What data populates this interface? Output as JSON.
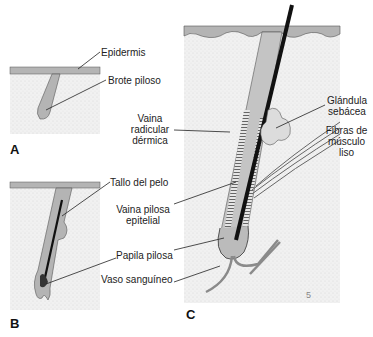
{
  "panels": {
    "a": {
      "label": "A"
    },
    "b": {
      "label": "B"
    },
    "c": {
      "label": "C"
    }
  },
  "labels": {
    "epidermis": "Epidermis",
    "brote_piloso": "Brote piloso",
    "tallo_del_pelo": "Tallo del pelo",
    "vaina_radicular_1": "Vaina",
    "vaina_radicular_2": "radicular",
    "vaina_radicular_3": "dérmica",
    "vaina_pilosa_1": "Vaina pilosa",
    "vaina_pilosa_2": "epitelial",
    "papila_pilosa": "Papila pilosa",
    "vaso_sanguineo": "Vaso sanguíneo",
    "glandula_1": "Glándula",
    "glandula_2": "sebácea",
    "fibras_1": "Fibras de",
    "fibras_2": "músculo",
    "fibras_3": "liso",
    "page_number": "5"
  },
  "colors": {
    "dermis": "#ececec",
    "epidermis": "#b4b4b4",
    "hair": "#111111",
    "line": "#222222"
  }
}
